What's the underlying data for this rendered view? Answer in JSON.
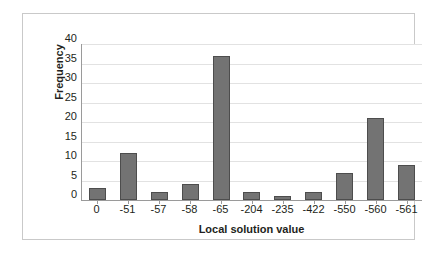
{
  "chart_data": {
    "type": "bar",
    "title": "",
    "xlabel": "Local solution value",
    "ylabel": "Frequency",
    "categories": [
      "0",
      "-51",
      "-57",
      "-58",
      "-65",
      "-204",
      "-235",
      "-422",
      "-550",
      "-560",
      "-561"
    ],
    "values": [
      3,
      12,
      2,
      4,
      37,
      2,
      1,
      2,
      7,
      21,
      9
    ],
    "ylim": [
      0,
      40
    ],
    "yticks": [
      0,
      5,
      10,
      15,
      20,
      25,
      30,
      35,
      40
    ],
    "ytick_labels": [
      "0",
      "5",
      "10",
      "15",
      "20",
      "25",
      "30",
      "35",
      "40"
    ],
    "grid": "horizontal",
    "legend": "none",
    "colors": {
      "bar_fill": "#737373",
      "bar_border": "#4d4d4d",
      "gridline": "#e2e2e2",
      "axis": "#9a9a9a",
      "frame": "#c9c9c9",
      "text": "#231f20",
      "background": "#ffffff"
    }
  }
}
